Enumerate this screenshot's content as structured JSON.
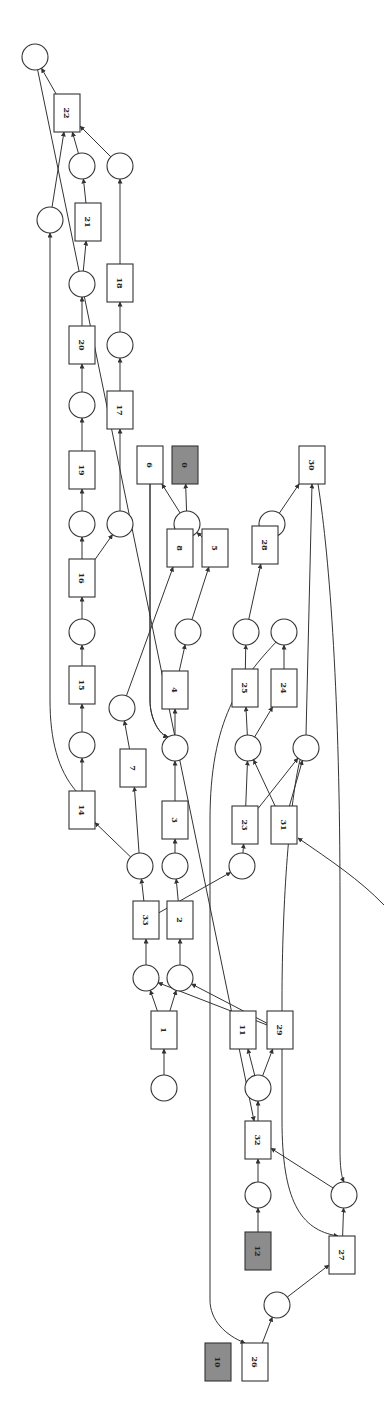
{
  "diagram": {
    "type": "petri-net",
    "orientation": "rotated-90",
    "colors": {
      "stroke": "#333333",
      "grey_fill": "#8c8c8c",
      "background": "#ffffff"
    },
    "transitions": [
      {
        "id": "22",
        "label": "22",
        "grey": false
      },
      {
        "id": "21",
        "label": "21",
        "grey": false
      },
      {
        "id": "18",
        "label": "18",
        "grey": false
      },
      {
        "id": "20",
        "label": "20",
        "grey": false
      },
      {
        "id": "17",
        "label": "17",
        "grey": false
      },
      {
        "id": "19",
        "label": "19",
        "grey": false
      },
      {
        "id": "6",
        "label": "6",
        "grey": false
      },
      {
        "id": "0",
        "label": "0",
        "grey": true
      },
      {
        "id": "30",
        "label": "30",
        "grey": false
      },
      {
        "id": "16",
        "label": "16",
        "grey": false
      },
      {
        "id": "8",
        "label": "8",
        "grey": false
      },
      {
        "id": "5",
        "label": "5",
        "grey": false
      },
      {
        "id": "28",
        "label": "28",
        "grey": false
      },
      {
        "id": "15",
        "label": "15",
        "grey": false
      },
      {
        "id": "4",
        "label": "4",
        "grey": false
      },
      {
        "id": "25",
        "label": "25",
        "grey": false
      },
      {
        "id": "24",
        "label": "24",
        "grey": false
      },
      {
        "id": "7",
        "label": "7",
        "grey": false
      },
      {
        "id": "14",
        "label": "14",
        "grey": false
      },
      {
        "id": "3",
        "label": "3",
        "grey": false
      },
      {
        "id": "23",
        "label": "23",
        "grey": false
      },
      {
        "id": "31",
        "label": "31",
        "grey": false
      },
      {
        "id": "33",
        "label": "33",
        "grey": false
      },
      {
        "id": "2",
        "label": "2",
        "grey": false
      },
      {
        "id": "1",
        "label": "1",
        "grey": false
      },
      {
        "id": "11",
        "label": "11",
        "grey": false
      },
      {
        "id": "29",
        "label": "29",
        "grey": false
      },
      {
        "id": "32",
        "label": "32",
        "grey": false
      },
      {
        "id": "12",
        "label": "12",
        "grey": true
      },
      {
        "id": "27",
        "label": "27",
        "grey": false
      },
      {
        "id": "10",
        "label": "10",
        "grey": true
      },
      {
        "id": "26",
        "label": "26",
        "grey": false
      }
    ],
    "places": [
      "p_end",
      "p_a",
      "p_b",
      "p_c",
      "p_d",
      "p_e",
      "p_f",
      "p_g",
      "p_h",
      "p_i",
      "p_j",
      "p_k",
      "p_l",
      "p_m",
      "p_n",
      "p_o",
      "p_q",
      "p_r",
      "p_s",
      "p_t",
      "p_u",
      "p_v",
      "p_w",
      "p_x",
      "p_y",
      "p_z",
      "p_aa",
      "p_ab",
      "p_ac",
      "p_ad",
      "p_ae",
      "p_af"
    ],
    "arcs": [
      [
        "22",
        "p_end"
      ],
      [
        "p_a",
        "22"
      ],
      [
        "p_b",
        "22"
      ],
      [
        "p_c",
        "22"
      ],
      [
        "21",
        "p_b"
      ],
      [
        "18",
        "p_c"
      ],
      [
        "p_d",
        "21"
      ],
      [
        "p_e",
        "18"
      ],
      [
        "20",
        "p_d"
      ],
      [
        "17",
        "p_e"
      ],
      [
        "p_f",
        "20"
      ],
      [
        "19",
        "p_f"
      ],
      [
        "p_g",
        "17"
      ],
      [
        "p_h",
        "19"
      ],
      [
        "p_i",
        "6"
      ],
      [
        "p_i",
        "0"
      ],
      [
        "p_j",
        "30"
      ],
      [
        "16",
        "p_h"
      ],
      [
        "16",
        "p_g"
      ],
      [
        "8",
        "p_i"
      ],
      [
        "5",
        "p_i"
      ],
      [
        "28",
        "p_j"
      ],
      [
        "p_k",
        "16"
      ],
      [
        "p_l",
        "5"
      ],
      [
        "p_m",
        "28"
      ],
      [
        "15",
        "p_k"
      ],
      [
        "4",
        "p_l"
      ],
      [
        "25",
        "p_m"
      ],
      [
        "24",
        "p_n"
      ],
      [
        "p_o",
        "8"
      ],
      [
        "p_q",
        "15"
      ],
      [
        "p_r",
        "4"
      ],
      [
        "p_s",
        "25"
      ],
      [
        "p_s",
        "24"
      ],
      [
        "p_t",
        "30"
      ],
      [
        "7",
        "p_o"
      ],
      [
        "6",
        "p_r"
      ],
      [
        "14",
        "p_q"
      ],
      [
        "3",
        "p_r"
      ],
      [
        "23",
        "p_s"
      ],
      [
        "23",
        "p_t"
      ],
      [
        "31",
        "p_s"
      ],
      [
        "31",
        "p_t"
      ],
      [
        "p_u",
        "14"
      ],
      [
        "p_u",
        "7"
      ],
      [
        "p_v",
        "3"
      ],
      [
        "p_w",
        "23"
      ],
      [
        "33",
        "p_u"
      ],
      [
        "2",
        "p_v"
      ],
      [
        "33",
        "p_w"
      ],
      [
        "p_x",
        "33"
      ],
      [
        "p_y",
        "2"
      ],
      [
        "1",
        "p_x"
      ],
      [
        "1",
        "p_y"
      ],
      [
        "29",
        "p_x"
      ],
      [
        "29",
        "p_y"
      ],
      [
        "p_z",
        "1"
      ],
      [
        "p_aa",
        "11"
      ],
      [
        "p_aa",
        "29"
      ],
      [
        "32",
        "p_aa"
      ],
      [
        "p_ab",
        "32"
      ],
      [
        "p_ac",
        "32"
      ],
      [
        "p_end",
        "32"
      ],
      [
        "12",
        "p_ab"
      ],
      [
        "27",
        "p_ac"
      ],
      [
        "30",
        "p_ac"
      ],
      [
        "p_t",
        "27"
      ],
      [
        "p_ad",
        "27"
      ],
      [
        "26",
        "p_ad"
      ],
      [
        "p_n",
        "26"
      ],
      [
        "p_ae",
        "31"
      ]
    ]
  }
}
